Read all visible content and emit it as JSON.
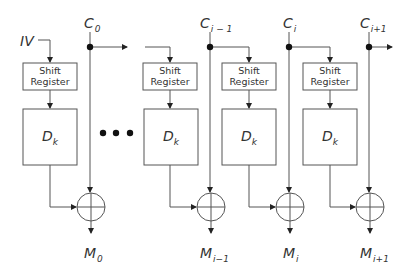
{
  "diagram": {
    "type": "CFB mode decryption block diagram",
    "iv_label": "IV",
    "ellipsis": "• • •",
    "stages": [
      {
        "cipher_label": "C",
        "cipher_sub": "0",
        "message_label": "M",
        "message_sub": "0",
        "shift_register_label": [
          "Shift",
          "Register"
        ],
        "decrypt_label": "D",
        "decrypt_sub": "k"
      },
      {
        "cipher_label": "C",
        "cipher_sub": "i − 1",
        "message_label": "M",
        "message_sub": "i−1",
        "shift_register_label": [
          "Shift",
          "Register"
        ],
        "decrypt_label": "D",
        "decrypt_sub": "k"
      },
      {
        "cipher_label": "C",
        "cipher_sub": "i",
        "message_label": "M",
        "message_sub": "i",
        "shift_register_label": [
          "Shift",
          "Register"
        ],
        "decrypt_label": "D",
        "decrypt_sub": "k"
      },
      {
        "cipher_label": "C",
        "cipher_sub": "i+1",
        "message_label": "M",
        "message_sub": "i+1",
        "shift_register_label": [
          "Shift",
          "Register"
        ],
        "decrypt_label": "D",
        "decrypt_sub": "k"
      }
    ],
    "colors": {
      "line": "#555555",
      "text": "#333333",
      "background": "#ffffff"
    }
  }
}
